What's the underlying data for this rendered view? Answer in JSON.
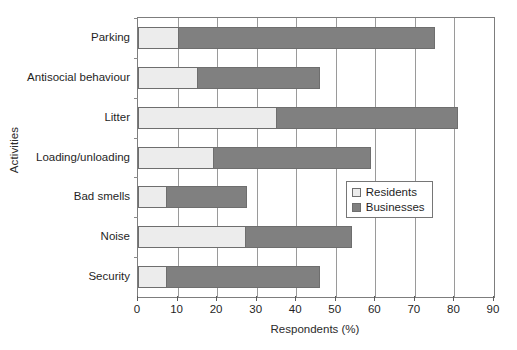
{
  "chart_data": {
    "type": "bar",
    "orientation": "horizontal",
    "stacked": true,
    "title": "",
    "xlabel": "Respondents (%)",
    "ylabel": "Activities",
    "xlim": [
      0,
      90
    ],
    "xticks": [
      0,
      10,
      20,
      30,
      40,
      50,
      60,
      70,
      80,
      90
    ],
    "grid": "vertical",
    "legend_position": "center-right-inside",
    "categories": [
      "Parking",
      "Antisocial behaviour",
      "Litter",
      "Loading/unloading",
      "Bad smells",
      "Noise",
      "Security"
    ],
    "series": [
      {
        "name": "Residents",
        "color": "#ececec",
        "values": [
          10,
          15,
          35,
          19,
          7,
          27,
          7
        ]
      },
      {
        "name": "Businesses",
        "color": "#808080",
        "values": [
          65,
          31,
          46,
          40,
          20.5,
          27,
          39
        ]
      }
    ],
    "totals": [
      75,
      46,
      81,
      59,
      27.5,
      54,
      46
    ]
  },
  "axes": {
    "x_title": "Respondents (%)",
    "y_title": "Activities",
    "x_tick_labels": [
      "0",
      "10",
      "20",
      "30",
      "40",
      "50",
      "60",
      "70",
      "80",
      "90"
    ]
  },
  "legend": {
    "entries": [
      {
        "label": "Residents",
        "swatch": "residents"
      },
      {
        "label": "Businesses",
        "swatch": "businesses"
      }
    ]
  },
  "colors": {
    "residents": "#ececec",
    "businesses": "#808080",
    "frame": "#7d7d7d",
    "gridline": "#9a9a9a",
    "text": "#1f1f1f"
  }
}
